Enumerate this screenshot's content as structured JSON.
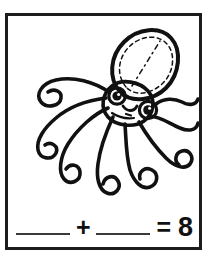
{
  "card": {
    "frame_color": "#1c1c1c",
    "background_color": "#ffffff",
    "ink_color": "#111111",
    "blank_line_color": "#3b3b3b"
  },
  "illustration": {
    "subject_name": "octopus-line-art",
    "style": "coloring-page outline",
    "tentacle_count": 8,
    "features": [
      "oval head with dashed inner outline",
      "two round eyes with highlights",
      "smiling mouth",
      "eight curling tentacles with rounded tips"
    ]
  },
  "equation": {
    "blank_1": "",
    "blank_1_placeholder": "",
    "plus_sign": "+",
    "blank_2": "",
    "blank_2_placeholder": "",
    "equals_sign": "=",
    "sum": "8",
    "full_text": "____ + ____ = 8"
  }
}
